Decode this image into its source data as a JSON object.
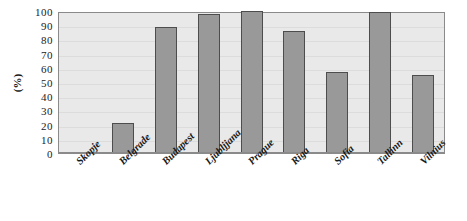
{
  "chart_data": {
    "type": "bar",
    "title": "",
    "xlabel": "",
    "ylabel": "(%)",
    "ylim": [
      0,
      100
    ],
    "ytick_step": 10,
    "yticks": [
      100,
      90,
      80,
      70,
      60,
      50,
      40,
      30,
      20,
      10,
      0
    ],
    "grid": true,
    "legend": "none",
    "categories": [
      "Skopje",
      "Belgrade",
      "Budapest",
      "Ljubljjana",
      "Prague",
      "Riga",
      "Sofia",
      "Tallinn",
      "Vilnius"
    ],
    "values": [
      0,
      21,
      89,
      98,
      100,
      86,
      57,
      99,
      55
    ],
    "colors": {
      "bar_fill": "#999999",
      "bar_border": "#4d4d4d",
      "plot_background": "#e9e9e9",
      "gridline": "#dcdcdc",
      "axis": "#8a8a8a",
      "text": "#1a1a1a",
      "page_background": "#ffffff"
    }
  }
}
